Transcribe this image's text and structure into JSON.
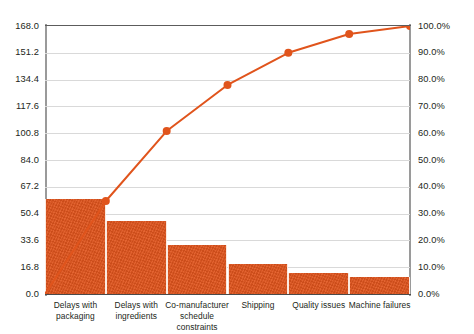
{
  "chart_data": {
    "type": "bar",
    "title": "",
    "subtitle": "",
    "xlabel": "",
    "ylabel": "",
    "y2label": "",
    "grid": true,
    "legend": false,
    "categories": [
      "Delays with packaging",
      "Delays with ingredients",
      "Co-manufacturer schedule constraints",
      "Shipping",
      "Quality issues",
      "Machine failures"
    ],
    "series": [
      {
        "name": "Count",
        "type": "bar",
        "axis": "left",
        "values": [
          59.5,
          45.8,
          30.7,
          18.8,
          13.2,
          10.7
        ]
      },
      {
        "name": "Cumulative %",
        "type": "line",
        "axis": "right",
        "values": [
          34.7,
          60.8,
          78.0,
          90.0,
          97.0,
          100.0
        ]
      }
    ],
    "ylim": [
      0,
      168
    ],
    "yticks": [
      0.0,
      16.8,
      33.6,
      50.4,
      67.2,
      84.0,
      100.8,
      117.6,
      134.4,
      151.2,
      168.0
    ],
    "ytick_labels": [
      "0.0",
      "16.8",
      "33.6",
      "50.4",
      "67.2",
      "84.0",
      "100.8",
      "117.6",
      "134.4",
      "151.2",
      "168.0"
    ],
    "y2lim": [
      0,
      100
    ],
    "y2ticks": [
      0,
      10,
      20,
      30,
      40,
      50,
      60,
      70,
      80,
      90,
      100
    ],
    "y2tick_labels": [
      "0.0%",
      "10.0%",
      "20.0%",
      "30.0%",
      "40.0%",
      "50.0%",
      "60.0%",
      "70.0%",
      "80.0%",
      "90.0%",
      "100.0%"
    ],
    "colors": {
      "bar": "#e0541c",
      "line": "#e0541c",
      "marker": "#e0541c",
      "grid": "#d9d9d9",
      "axis": "#7a7a7a",
      "text": "#231f20",
      "background": "#ffffff"
    }
  }
}
